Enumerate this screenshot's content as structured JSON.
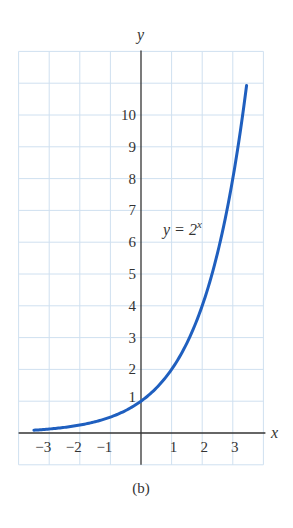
{
  "chart_data": {
    "type": "line",
    "title": "",
    "caption": "(b)",
    "xlabel": "x",
    "ylabel": "y",
    "xlim": [
      -4,
      4
    ],
    "ylim": [
      -1,
      12
    ],
    "grid": true,
    "x_ticks": [
      -3,
      -2,
      -1,
      1,
      2,
      3
    ],
    "x_tick_labels": [
      "−3",
      "−2",
      "−1",
      "1",
      "2",
      "3"
    ],
    "y_ticks": [
      1,
      2,
      3,
      4,
      5,
      6,
      7,
      8,
      9,
      10
    ],
    "y_tick_labels": [
      "1",
      "2",
      "3",
      "4",
      "5",
      "6",
      "7",
      "8",
      "9",
      "10"
    ],
    "series": [
      {
        "name": "y = 2^x",
        "function": "2^x",
        "domain": [
          -3.5,
          3.45
        ],
        "color": "#1f5fbf",
        "x": [
          -3.5,
          -3,
          -2.5,
          -2,
          -1.5,
          -1,
          -0.5,
          0,
          0.5,
          1,
          1.5,
          2,
          2.5,
          3,
          3.45
        ],
        "values": [
          0.09,
          0.125,
          0.18,
          0.25,
          0.35,
          0.5,
          0.71,
          1,
          1.41,
          2,
          2.83,
          4,
          5.66,
          8,
          10.9
        ]
      }
    ],
    "annotations": [
      {
        "text": "y = 2",
        "superscript": "x",
        "x": 1.5,
        "y": 6.3
      }
    ]
  },
  "colors": {
    "curve": "#1f5fbf",
    "grid": "#cfe0f0",
    "axis": "#333333",
    "text": "#333333"
  }
}
